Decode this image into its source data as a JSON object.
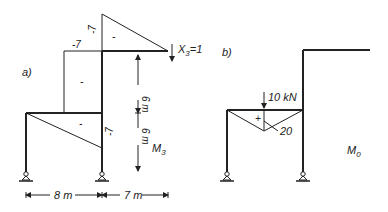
{
  "panel_a": {
    "label": "a)",
    "sign_upper_triangle": "-",
    "sign_left_rect": "-",
    "sign_lower_triangle": "-",
    "value_top_vertical": "-7",
    "value_left_horizontal": "-7",
    "value_lower_right": "-7",
    "load_label": "X",
    "load_sub": "3",
    "load_eq": "=1",
    "diagram_name": "M",
    "diagram_sub": "3",
    "dim_upper": "6 m",
    "dim_lower": "6 m",
    "dim_left_span": "8 m",
    "dim_right_span": "7 m"
  },
  "panel_b": {
    "label": "b)",
    "load_label": "10 kN",
    "sign_triangle": "+",
    "peak_value": "20",
    "diagram_name": "M",
    "diagram_sub": "0"
  },
  "colors": {
    "line": "#222222",
    "background": "#ffffff"
  }
}
